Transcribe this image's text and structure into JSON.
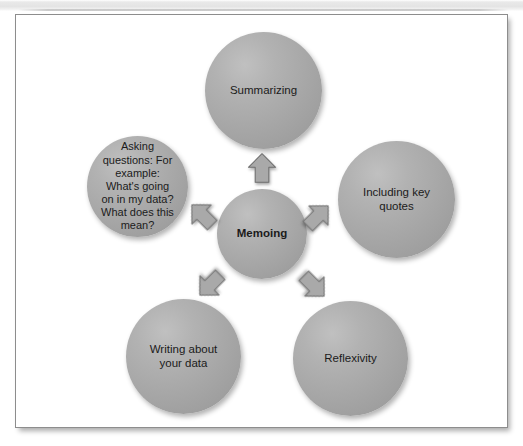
{
  "figure": {
    "center_node": {
      "id": "memoing",
      "label": "Memoing",
      "bold": true
    },
    "outer_nodes": [
      {
        "id": "summarizing",
        "label": "Summarizing",
        "position": "top"
      },
      {
        "id": "quotes",
        "label": "Including key\nquotes",
        "position": "right"
      },
      {
        "id": "reflexivity",
        "label": "Reflexivity",
        "position": "bottom-right"
      },
      {
        "id": "writing",
        "label": "Writing about\nyour data",
        "position": "bottom-left"
      },
      {
        "id": "asking",
        "label": "Asking\nquestions: For\nexample:\nWhat's going\non in my data?\nWhat does this\nmean?",
        "position": "left"
      }
    ],
    "arrows": [
      {
        "id": "arrow-up",
        "direction": "up",
        "from": "memoing",
        "to": "summarizing"
      },
      {
        "id": "arrow-up-right",
        "direction": "up-right",
        "from": "memoing",
        "to": "quotes"
      },
      {
        "id": "arrow-up-left",
        "direction": "up-left",
        "from": "memoing",
        "to": "asking"
      },
      {
        "id": "arrow-down-left",
        "direction": "down-left",
        "from": "memoing",
        "to": "writing"
      },
      {
        "id": "arrow-down-right",
        "direction": "down-right",
        "from": "memoing",
        "to": "reflexivity"
      }
    ],
    "colors": {
      "node_fill": "#a8a8a8",
      "node_fill_highlight": "#c0c0c0",
      "node_fill_shadow": "#969696",
      "arrow_fill": "#a9a9a9",
      "arrow_outline": "#6f6f6f",
      "text": "#1b1b1b",
      "frame_border": "#8d8d8d",
      "canvas_background": "#ffffff",
      "page_background": "#ffffff"
    }
  }
}
